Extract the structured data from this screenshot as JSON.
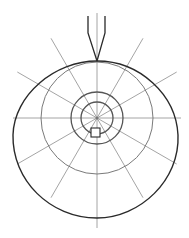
{
  "diagram": {
    "type": "polar-grid-line-drawing",
    "width": 189,
    "height": 238,
    "background": "#ffffff",
    "center": {
      "x": 97,
      "y": 118
    },
    "colors": {
      "outline": "#2a2a2a",
      "grid": "#9a9a9a",
      "rings": "#555555"
    },
    "outer_shape": {
      "path": "M97 61 C 140 61, 176 95, 178 135 C 180 180, 140 218, 97 218 C 50 218, 12 180, 13 135 C 14 95, 55 61, 97 61 Z"
    },
    "rings": [
      {
        "name": "outer-ring",
        "r": 56
      },
      {
        "name": "middle-ring",
        "r": 26
      },
      {
        "name": "inner-ring",
        "r": 16
      }
    ],
    "radial_lines": [
      {
        "angle": 0,
        "length": 84
      },
      {
        "angle": 30,
        "length": 92
      },
      {
        "angle": 60,
        "length": 92
      },
      {
        "angle": 90,
        "length": 110
      },
      {
        "angle": 120,
        "length": 92
      },
      {
        "angle": 150,
        "length": 92
      },
      {
        "angle": 180,
        "length": 84
      },
      {
        "angle": 210,
        "length": 92
      },
      {
        "angle": 240,
        "length": 92
      },
      {
        "angle": 270,
        "length": 105
      },
      {
        "angle": 300,
        "length": 92
      },
      {
        "angle": 330,
        "length": 92
      }
    ],
    "stem": {
      "left": "M88 16 L88 33 L97 61",
      "right": "M105 16 L105 33 L97 61"
    },
    "square": {
      "x": 91,
      "y": 128,
      "size": 9
    }
  }
}
